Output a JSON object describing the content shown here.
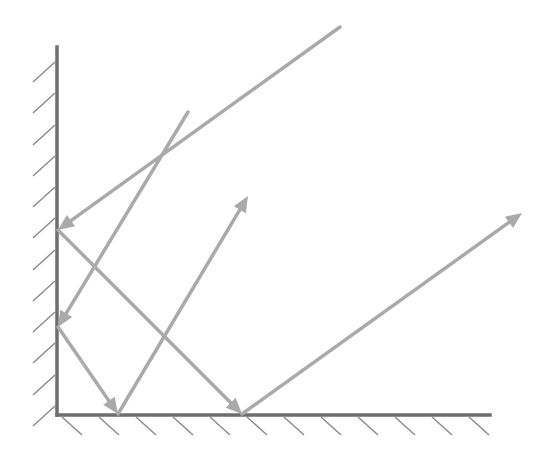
{
  "diagram": {
    "title": "",
    "colors": {
      "wall": "#6e6e6e",
      "hatch": "#8a8a8a",
      "ray": "#aaaaaa",
      "background": "#ffffff"
    },
    "walls": {
      "vertical": {
        "x": 57,
        "y1": 47,
        "y2": 415
      },
      "horizontal": {
        "y": 415,
        "x1": 57,
        "x2": 490
      }
    },
    "vertical_hatches_y": [
      62,
      93,
      125,
      156,
      187,
      218,
      250,
      281,
      312,
      343,
      375,
      406
    ],
    "horizontal_hatches_x": [
      74,
      111,
      148,
      185,
      222,
      259,
      296,
      333,
      370,
      407,
      444,
      481
    ],
    "rays": [
      {
        "name": "ray-1",
        "segments": [
          {
            "from": [
              340,
              27
            ],
            "to": [
              58,
              230
            ],
            "arrow": true
          },
          {
            "from": [
              58,
              230
            ],
            "to": [
              242,
              414
            ],
            "arrow": true
          },
          {
            "from": [
              242,
              414
            ],
            "to": [
              522,
              213
            ],
            "arrow": true
          }
        ]
      },
      {
        "name": "ray-2",
        "segments": [
          {
            "from": [
              188,
              112
            ],
            "to": [
              58,
              327
            ],
            "arrow": true
          },
          {
            "from": [
              58,
              327
            ],
            "to": [
              118,
              414
            ],
            "arrow": true
          },
          {
            "from": [
              118,
              414
            ],
            "to": [
              248,
              196
            ],
            "arrow": true
          }
        ]
      }
    ]
  }
}
